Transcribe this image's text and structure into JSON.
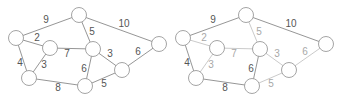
{
  "colors": {
    "dark_edge": "#8a8a8a",
    "light_edge": "#c4c4c4",
    "dark_label": "#555555",
    "light_label": "#a8a8a8",
    "node_stroke": "#9a9a9a",
    "node_fill": "#ffffff"
  },
  "nodes": [
    {
      "id": "A",
      "x": 16,
      "y": 38
    },
    {
      "id": "B",
      "x": 50,
      "y": 48
    },
    {
      "id": "C",
      "x": 29,
      "y": 78
    },
    {
      "id": "D",
      "x": 79,
      "y": 15
    },
    {
      "id": "E",
      "x": 93,
      "y": 49
    },
    {
      "id": "F",
      "x": 85,
      "y": 86
    },
    {
      "id": "G",
      "x": 122,
      "y": 70
    },
    {
      "id": "H",
      "x": 159,
      "y": 44
    }
  ],
  "edges": [
    {
      "from": "A",
      "to": "D",
      "weight": "9",
      "lx": 46,
      "ly": 23
    },
    {
      "from": "A",
      "to": "B",
      "weight": "2",
      "lx": 37,
      "ly": 41
    },
    {
      "from": "A",
      "to": "C",
      "weight": "4",
      "lx": 20,
      "ly": 66
    },
    {
      "from": "B",
      "to": "C",
      "weight": "3",
      "lx": 44,
      "ly": 68
    },
    {
      "from": "B",
      "to": "E",
      "weight": "7",
      "lx": 67,
      "ly": 57
    },
    {
      "from": "D",
      "to": "E",
      "weight": "5",
      "lx": 92,
      "ly": 35
    },
    {
      "from": "D",
      "to": "H",
      "weight": "10",
      "lx": 124,
      "ly": 27
    },
    {
      "from": "E",
      "to": "F",
      "weight": "6",
      "lx": 84,
      "ly": 72
    },
    {
      "from": "E",
      "to": "G",
      "weight": "3",
      "lx": 110,
      "ly": 57
    },
    {
      "from": "C",
      "to": "F",
      "weight": "8",
      "lx": 58,
      "ly": 91
    },
    {
      "from": "F",
      "to": "G",
      "weight": "5",
      "lx": 104,
      "ly": 87
    },
    {
      "from": "G",
      "to": "H",
      "weight": "6",
      "lx": 138,
      "ly": 55
    }
  ],
  "graphs": [
    {
      "name": "full-graph",
      "offset_x": 0,
      "highlighted": []
    },
    {
      "name": "result-graph",
      "offset_x": 167,
      "highlighted": [
        "A-B",
        "B-C",
        "B-E",
        "D-E",
        "E-G",
        "G-H",
        "F-G"
      ]
    }
  ]
}
